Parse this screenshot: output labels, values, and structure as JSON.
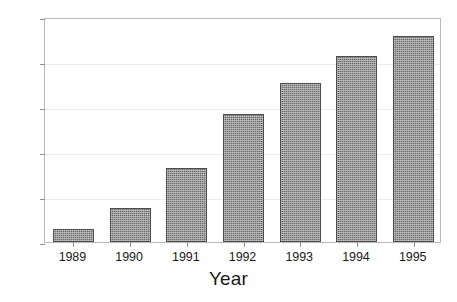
{
  "chart_data": {
    "type": "bar",
    "title": "",
    "subtitle": "",
    "xlabel": "Year",
    "ylabel": "",
    "categories": [
      "1989",
      "1990",
      "1991",
      "1992",
      "1993",
      "1994",
      "1995"
    ],
    "values": [
      5.8,
      15.2,
      33.0,
      57.0,
      70.8,
      82.7,
      91.6
    ],
    "series": [
      {
        "name": "",
        "values": [
          5.8,
          15.2,
          33.0,
          57.0,
          70.8,
          82.7,
          91.6
        ]
      }
    ],
    "ylim": [
      0,
      100
    ],
    "yticks": [
      0,
      20,
      40,
      60,
      80,
      100
    ],
    "ytick_labels": [
      "0",
      "20",
      "40",
      "60",
      "80",
      "100"
    ],
    "xtick_labels": [
      "1989",
      "1990",
      "1991",
      "1992",
      "1993",
      "1994",
      "1995"
    ],
    "grid": true,
    "grid_axis": "y",
    "legend": false,
    "legend_position": "none",
    "annotations": [],
    "bar_fill_color": "#6e6e6e",
    "bar_edge_color": "#4d4d4d",
    "bar_pattern": "fine-dotted-hatch",
    "grid_color": "#eceded",
    "frame_color": "#b9babc",
    "text_color": "#1a1a1a",
    "background_color": "#ffffff"
  }
}
